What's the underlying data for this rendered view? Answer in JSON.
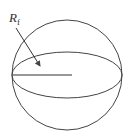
{
  "diagram": {
    "type": "sphere",
    "label": {
      "main": "R",
      "subscript": "f"
    },
    "stroke_color": "#444444",
    "sphere": {
      "cx": 67,
      "cy": 75,
      "r": 55
    },
    "equator": {
      "cx": 67,
      "cy": 75,
      "rx": 55,
      "ry": 23
    },
    "radius_line": {
      "x1": 13,
      "y1": 75,
      "x2": 72,
      "y2": 75
    },
    "arrow": {
      "x1": 16,
      "y1": 28,
      "x2": 40,
      "y2": 66
    }
  }
}
